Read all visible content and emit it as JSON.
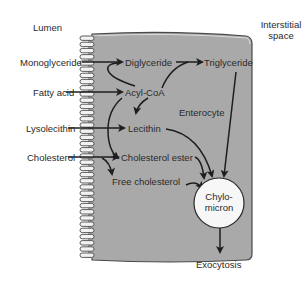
{
  "diagram": {
    "regions": {
      "lumen": "Lumen",
      "interstitial_line1": "Interstitial",
      "interstitial_line2": "space",
      "cell": "Enterocyte"
    },
    "inputs": {
      "monoglyceride": "Monoglyceride",
      "fatty_acid": "Fatty acid",
      "lysolecithin": "Lysolecithin",
      "cholesterol": "Cholesterol"
    },
    "intermediates": {
      "diglyceride": "Diglyceride",
      "acyl_coa": "Acyl-CoA",
      "triglyceride": "Triglyceride",
      "lecithin": "Lecithin",
      "cholesterol_ester": "Cholesterol ester",
      "free_cholesterol": "Free cholesterol"
    },
    "chylomicron": {
      "line1": "Chylo-",
      "line2": "micron"
    },
    "output": "Exocytosis",
    "colors": {
      "cell_fill": "#a9a9a9",
      "cell_border": "#4a4a4a",
      "arrow": "#1e1e1e",
      "chylomicron_fill": "#f7f7f7",
      "text": "#2a2a2a"
    },
    "edges": [
      [
        "Monoglyceride",
        "Diglyceride"
      ],
      [
        "Fatty acid",
        "Acyl-CoA"
      ],
      [
        "Acyl-CoA",
        "Diglyceride"
      ],
      [
        "Diglyceride",
        "Triglyceride"
      ],
      [
        "Acyl-CoA",
        "Triglyceride"
      ],
      [
        "Acyl-CoA",
        "Lecithin"
      ],
      [
        "Lysolecithin",
        "Lecithin"
      ],
      [
        "Acyl-CoA",
        "Cholesterol ester"
      ],
      [
        "Cholesterol",
        "Cholesterol ester"
      ],
      [
        "Cholesterol",
        "Free cholesterol"
      ],
      [
        "Triglyceride",
        "Chylomicron"
      ],
      [
        "Lecithin",
        "Chylomicron"
      ],
      [
        "Cholesterol ester",
        "Chylomicron"
      ],
      [
        "Free cholesterol",
        "Chylomicron"
      ],
      [
        "Chylomicron",
        "Exocytosis"
      ]
    ]
  }
}
